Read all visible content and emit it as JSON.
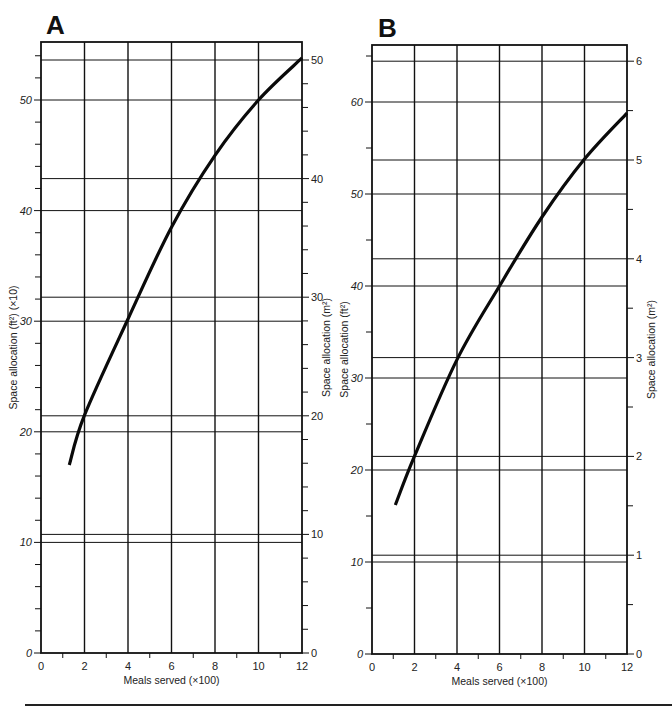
{
  "chart_data": [
    {
      "type": "line",
      "panel": "A",
      "title": "A",
      "xlabel": "Meals served (×100)",
      "ylabel": "Space allocation (ft²) (×10)",
      "ylabel_right": "Space allocation (m²)",
      "xlim": [
        0,
        12
      ],
      "ylim": [
        0,
        54
      ],
      "ylim_right": [
        0,
        50
      ],
      "x_ticks": [
        0,
        2,
        4,
        6,
        8,
        10,
        12
      ],
      "y_ticks_labeled": [
        0,
        10,
        20,
        30,
        40,
        50
      ],
      "y_right_ticks_labeled": [
        0,
        10,
        20,
        30,
        40,
        50
      ],
      "grid": true,
      "series": [
        {
          "name": "Space allocation",
          "x": [
            1.3,
            2,
            4,
            6,
            8,
            10,
            12
          ],
          "values": [
            17.0,
            21.5,
            30.2,
            38.5,
            45.0,
            50.0,
            53.8
          ]
        }
      ]
    },
    {
      "type": "line",
      "panel": "B",
      "title": "B",
      "xlabel": "Meals served (×100)",
      "ylabel": "Space allocation (ft²)",
      "ylabel_right": "Space allocation (m²)",
      "xlim": [
        0,
        12
      ],
      "ylim": [
        0,
        65
      ],
      "ylim_right": [
        0,
        6
      ],
      "x_ticks": [
        0,
        2,
        4,
        6,
        8,
        10,
        12
      ],
      "y_ticks_labeled": [
        0,
        10,
        20,
        30,
        40,
        50,
        60
      ],
      "y_right_ticks_labeled": [
        0,
        1,
        2,
        3,
        4,
        5,
        6
      ],
      "grid": true,
      "series": [
        {
          "name": "Space allocation",
          "x": [
            1.1,
            2,
            4,
            6,
            8,
            10,
            12
          ],
          "values": [
            16.2,
            21.5,
            32.0,
            40.0,
            47.5,
            53.8,
            58.8
          ]
        }
      ]
    }
  ],
  "panels": {
    "A": {
      "letter": "A",
      "xlabel": "Meals served (×100)",
      "ylabel": "Space allocation (ft²) (×10)",
      "ylabel_right": "Space allocation (m²)"
    },
    "B": {
      "letter": "B",
      "xlabel": "Meals served (×100)",
      "ylabel": "Space allocation (ft²)",
      "ylabel_right": "Space allocation (m²)"
    }
  }
}
